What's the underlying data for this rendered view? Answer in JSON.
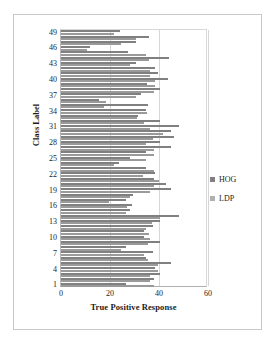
{
  "chart_data": {
    "type": "bar",
    "orientation": "horizontal",
    "title": "",
    "xlabel": "True Positive Response",
    "ylabel": "Class Label",
    "xlim": [
      0,
      60
    ],
    "xticks": [
      0,
      20,
      40,
      60
    ],
    "yticks": [
      1,
      4,
      7,
      10,
      13,
      16,
      19,
      22,
      25,
      28,
      31,
      34,
      37,
      40,
      43,
      46,
      49
    ],
    "grid": true,
    "legend_position": "right",
    "colors": {
      "HOG": "#808080",
      "LDP": "#b0b0b0"
    },
    "categories": [
      1,
      2,
      3,
      4,
      5,
      6,
      7,
      8,
      9,
      10,
      11,
      12,
      13,
      14,
      15,
      16,
      17,
      18,
      19,
      20,
      21,
      22,
      23,
      24,
      25,
      26,
      27,
      28,
      29,
      30,
      31,
      32,
      33,
      34,
      35,
      36,
      37,
      38,
      39,
      40,
      41,
      42,
      43,
      44,
      45,
      46,
      47,
      48,
      49
    ],
    "series": [
      {
        "name": "HOG",
        "values": [
          26.5,
          38.0,
          40.5,
          38.5,
          45.0,
          34.5,
          37.5,
          26.5,
          40.5,
          34.0,
          34.0,
          37.5,
          40.5,
          48.0,
          28.0,
          29.0,
          26.5,
          29.5,
          45.0,
          43.0,
          38.0,
          38.5,
          34.5,
          23.5,
          28.0,
          34.5,
          45.0,
          40.5,
          46.0,
          45.0,
          48.0,
          40.5,
          31.5,
          34.5,
          35.5,
          15.5,
          32.5,
          40.5,
          35.0,
          43.5,
          39.5,
          38.5,
          30.5,
          44.0,
          27.5,
          12.0,
          30.5,
          36.0,
          24.0
        ]
      },
      {
        "name": "LDP",
        "values": [
          38.0,
          36.5,
          36.5,
          39.5,
          39.5,
          35.5,
          34.0,
          24.5,
          35.5,
          36.5,
          36.0,
          34.5,
          37.0,
          40.5,
          26.5,
          27.0,
          19.5,
          28.0,
          36.5,
          38.0,
          40.0,
          33.5,
          38.0,
          21.5,
          34.5,
          38.0,
          38.0,
          34.5,
          37.5,
          41.5,
          36.5,
          34.0,
          31.0,
          35.0,
          17.5,
          18.5,
          30.5,
          38.0,
          38.5,
          38.5,
          36.5,
          36.5,
          28.0,
          36.0,
          34.5,
          10.5,
          24.5,
          30.5,
          21.5
        ]
      }
    ]
  },
  "legend": {
    "items": [
      {
        "label": "HOG"
      },
      {
        "label": "LDP"
      }
    ]
  }
}
